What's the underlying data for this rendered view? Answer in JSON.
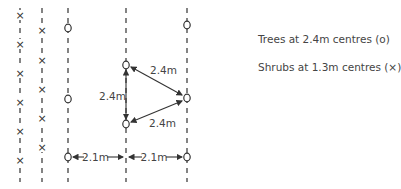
{
  "legend": {
    "trees": "Trees at 2.4m centres (o)",
    "shrubs": "Shrubs at 1.3m centres (×)"
  },
  "markers": {
    "tree_symbol": "o",
    "shrub_symbol": "×"
  },
  "dimensions": {
    "triangle_top": "2.4m",
    "triangle_left": "2.4m",
    "triangle_bottom": "2.4m",
    "row_spacing_left": "2.1m",
    "row_spacing_right": "2.1m"
  },
  "colors": {
    "line": "#333333",
    "text": "#444444"
  }
}
